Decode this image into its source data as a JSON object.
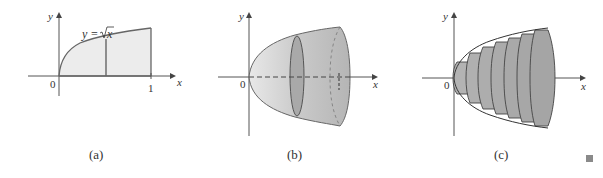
{
  "figure": {
    "panels": [
      {
        "id": "a",
        "caption": "(a)",
        "x_axis_label": "x",
        "y_axis_label": "y",
        "origin_label": "0",
        "x_tick_label": "1",
        "curve_label_lhs": "y =",
        "curve_label_radicand": "x",
        "description": "Region under y = sqrt(x) from 0 to 1 with vertical strip"
      },
      {
        "id": "b",
        "caption": "(b)",
        "x_axis_label": "x",
        "y_axis_label": "y",
        "origin_label": "0",
        "x_tick_label": "1",
        "description": "Solid of revolution (paraboloid) with cross-sectional disk"
      },
      {
        "id": "c",
        "caption": "(c)",
        "x_axis_label": "x",
        "y_axis_label": "y",
        "origin_label": "0",
        "description": "Approximation of solid by cylindrical disks"
      }
    ],
    "end_mark": "proof-end-square",
    "colors": {
      "region_fill": "#ececec",
      "solid_fill": "#c4c4c4",
      "disk_fill": "#a8a8a8",
      "stroke": "#555555",
      "end_mark": "#8a8a8a"
    }
  }
}
